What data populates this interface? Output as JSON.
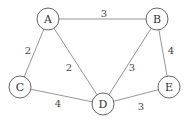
{
  "graph": {
    "type": "weighted-undirected-graph",
    "nodes": [
      {
        "id": "A",
        "label": "A",
        "x": 48,
        "y": 19
      },
      {
        "id": "B",
        "label": "B",
        "x": 157,
        "y": 19
      },
      {
        "id": "C",
        "label": "C",
        "x": 20,
        "y": 87
      },
      {
        "id": "D",
        "label": "D",
        "x": 103,
        "y": 104
      },
      {
        "id": "E",
        "label": "E",
        "x": 169,
        "y": 87
      }
    ],
    "edges": [
      {
        "from": "A",
        "to": "B",
        "weight": "3",
        "lx": 104,
        "ly": 13
      },
      {
        "from": "A",
        "to": "C",
        "weight": "2",
        "lx": 28,
        "ly": 50
      },
      {
        "from": "A",
        "to": "D",
        "weight": "2",
        "lx": 69,
        "ly": 67
      },
      {
        "from": "B",
        "to": "D",
        "weight": "3",
        "lx": 132,
        "ly": 67
      },
      {
        "from": "B",
        "to": "E",
        "weight": "4",
        "lx": 171,
        "ly": 50
      },
      {
        "from": "C",
        "to": "D",
        "weight": "4",
        "lx": 58,
        "ly": 103
      },
      {
        "from": "D",
        "to": "E",
        "weight": "3",
        "lx": 141,
        "ly": 106
      }
    ],
    "node_radius": 11,
    "colors": {
      "edge": "#8a8a8a",
      "node_stroke": "#555555",
      "text": "#333333"
    }
  }
}
